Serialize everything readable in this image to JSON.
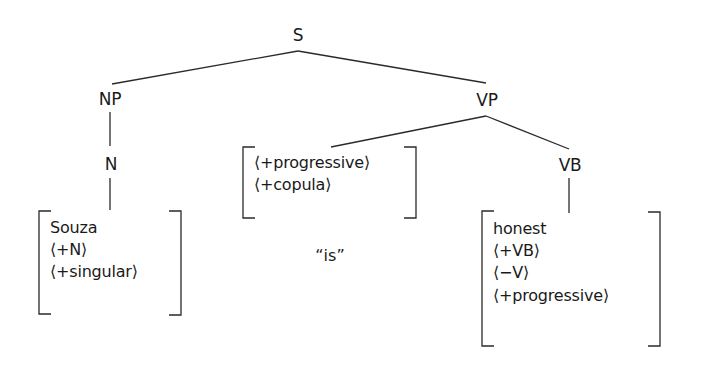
{
  "diagram": {
    "type": "syntax-tree",
    "nodes": {
      "s": {
        "label": "S"
      },
      "np": {
        "label": "NP"
      },
      "vp": {
        "label": "VP"
      },
      "n": {
        "label": "N"
      },
      "vb": {
        "label": "VB"
      }
    },
    "feature_boxes": {
      "souza": {
        "lines": [
          "Souza",
          "⟨+N⟩",
          "⟨+singular⟩"
        ]
      },
      "aux": {
        "lines": [
          "⟨+progressive⟩",
          "⟨+copula⟩"
        ]
      },
      "honest": {
        "lines": [
          "honest",
          "⟨+VB⟩",
          "⟨−V⟩",
          "⟨+progressive⟩"
        ]
      }
    },
    "surface_form": {
      "label": "“is”"
    },
    "edges": [
      {
        "from": "S",
        "to": "NP"
      },
      {
        "from": "S",
        "to": "VP"
      },
      {
        "from": "NP",
        "to": "N"
      },
      {
        "from": "N",
        "to": "Souza feature box"
      },
      {
        "from": "VP",
        "to": "progressive/copula feature box"
      },
      {
        "from": "VP",
        "to": "VB"
      },
      {
        "from": "VB",
        "to": "honest feature box"
      }
    ],
    "colors": {
      "ink": "#1a1a1a",
      "background": "#ffffff"
    }
  }
}
